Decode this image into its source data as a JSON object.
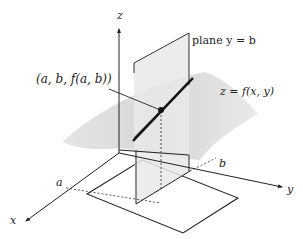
{
  "figure": {
    "labels": {
      "z_axis": "z",
      "x_axis": "x",
      "y_axis": "y",
      "a_tick": "a",
      "b_tick": "b",
      "point": "(a, b, f(a, b))",
      "plane": "plane y = b",
      "surface": "z = f(x, y)"
    },
    "colors": {
      "surface_fill": "#d9d9d9",
      "plane_fill": "#e6e6e6",
      "line": "#222222",
      "background": "#ffffff"
    }
  }
}
